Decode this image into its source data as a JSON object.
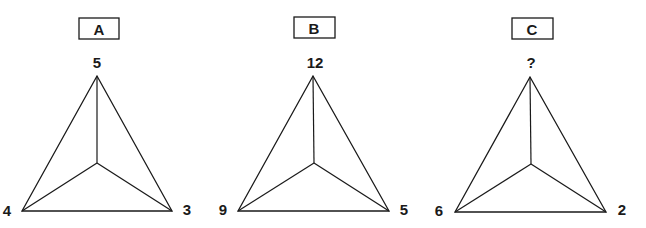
{
  "puzzle": {
    "figures": [
      {
        "label": "A",
        "top": "5",
        "left": "4",
        "right": "3"
      },
      {
        "label": "B",
        "top": "12",
        "left": "9",
        "right": "5"
      },
      {
        "label": "C",
        "top": "?",
        "left": "6",
        "right": "2"
      }
    ]
  },
  "colors": {
    "line": "#1a1a1a",
    "background": "#ffffff"
  }
}
